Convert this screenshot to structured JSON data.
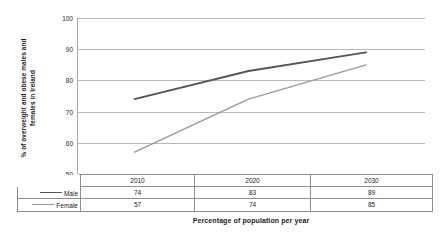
{
  "chart_data": {
    "type": "line",
    "title": "",
    "xlabel": "Percentage of population per year",
    "ylabel": "% of overweight and obese males and females in Ireland",
    "ylabel_line1": "% of overweight and obese males and",
    "ylabel_line2": "females in Ireland",
    "categories": [
      "2010",
      "2020",
      "2030"
    ],
    "series": [
      {
        "name": "Male",
        "values": [
          74,
          83,
          89
        ],
        "color": "#565656"
      },
      {
        "name": "Female",
        "values": [
          57,
          74,
          85
        ],
        "color": "#9a9a9a"
      }
    ],
    "ylim": [
      50,
      100
    ],
    "yticks": [
      100,
      90,
      80,
      70,
      60,
      50
    ],
    "ytick_labels": [
      "100",
      "90",
      "80",
      "70",
      "60",
      "50"
    ],
    "grid": true,
    "legend_position": "table-below"
  },
  "table": {
    "corner_label": "",
    "columns": [
      "2010",
      "2020",
      "2030"
    ],
    "rows": [
      {
        "label": "Male",
        "swatch": "line-swatch-male",
        "values": [
          "74",
          "83",
          "89"
        ]
      },
      {
        "label": "Female",
        "swatch": "line-swatch-female",
        "values": [
          "57",
          "74",
          "85"
        ]
      }
    ]
  },
  "artifacts": {
    "right_mark": ""
  }
}
